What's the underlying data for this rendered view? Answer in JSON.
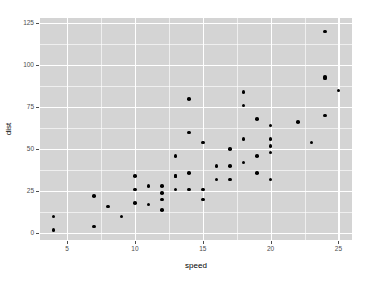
{
  "chart_data": {
    "type": "scatter",
    "title": "",
    "xlabel": "speed",
    "ylabel": "dist",
    "xlim": [
      3.0,
      26.0
    ],
    "ylim": [
      -4.0,
      128.0
    ],
    "xticks": [
      5,
      10,
      15,
      20,
      25
    ],
    "xtick_labels": [
      "5",
      "10",
      "15",
      "20",
      "25"
    ],
    "yticks": [
      0,
      25,
      50,
      75,
      100,
      125
    ],
    "ytick_labels": [
      "0",
      "25",
      "50",
      "75",
      "100",
      "125"
    ],
    "xminor": [
      7.5,
      12.5,
      17.5,
      22.5
    ],
    "yminor": [
      12.5,
      37.5,
      62.5,
      87.5,
      112.5
    ],
    "grid": true,
    "legend": "none",
    "point_color": "#000000",
    "panel_color": "#d4d4d4",
    "gridline_color": "#ffffff",
    "n_points": 50,
    "x": [
      4,
      4,
      7,
      7,
      8,
      9,
      10,
      10,
      10,
      11,
      11,
      12,
      12,
      12,
      12,
      13,
      13,
      13,
      13,
      14,
      14,
      14,
      14,
      15,
      15,
      15,
      16,
      16,
      17,
      17,
      17,
      18,
      18,
      18,
      18,
      19,
      19,
      19,
      20,
      20,
      20,
      20,
      20,
      22,
      23,
      24,
      24,
      24,
      24,
      25
    ],
    "y": [
      2,
      10,
      4,
      22,
      16,
      10,
      18,
      26,
      34,
      17,
      28,
      14,
      20,
      24,
      28,
      26,
      34,
      34,
      46,
      26,
      36,
      60,
      80,
      20,
      26,
      54,
      32,
      40,
      32,
      40,
      50,
      42,
      56,
      76,
      84,
      36,
      46,
      68,
      32,
      48,
      52,
      56,
      64,
      66,
      54,
      70,
      92,
      93,
      120,
      85
    ]
  }
}
